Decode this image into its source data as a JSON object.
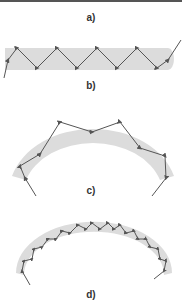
{
  "figure": {
    "panels": [
      {
        "id": "a",
        "label": "a)"
      },
      {
        "id": "b",
        "label": "b)",
        "description": "straight fiber with zigzag total internal reflection"
      },
      {
        "id": "c",
        "label": "c)",
        "description": "bent fiber, few reflections"
      },
      {
        "id": "d",
        "label": "d)",
        "description": "bent thin fiber, many reflections"
      }
    ],
    "colors": {
      "fiber_fill": "#dcdcdc",
      "ray": "#555555",
      "label": "#333333",
      "top_border": "#555555"
    }
  }
}
